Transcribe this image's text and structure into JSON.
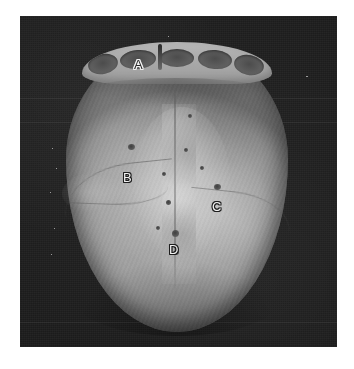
{
  "figure": {
    "kind": "anatomical-photograph",
    "plate": {
      "left": 20,
      "top": 16,
      "width": 317,
      "height": 331,
      "background_color": "#1c1c1c",
      "page_color": "#ffffff"
    },
    "specimen": {
      "bone_color": "#a8a8a8",
      "bone_highlight": "#c6c6c6",
      "bone_shadow": "#6f6f6f",
      "socket_color": "#4c4c4c",
      "foramen_color": "#3f3f3f"
    },
    "labels": [
      {
        "id": "a",
        "text": "A",
        "style": "dark-glyph-light-outline",
        "x": 138,
        "y": 65,
        "points_to": "frontal bone / supraorbital margin region at top of the cranium"
      },
      {
        "id": "b",
        "text": "B",
        "style": "light-glyph-dark-outline",
        "x": 127,
        "y": 178,
        "points_to": "left parietal bone with parietal foramen below the letter"
      },
      {
        "id": "c",
        "text": "C",
        "style": "light-glyph-dark-outline",
        "x": 216,
        "y": 207,
        "points_to": "right parietal bone with emissary foramen below the letter"
      },
      {
        "id": "d",
        "text": "D",
        "style": "light-glyph-dark-outline",
        "x": 173,
        "y": 250,
        "points_to": "sagittal suture / posterior midline"
      }
    ],
    "features": {
      "sagittal_suture": "faint vertical midline groove running front to back",
      "squamous_sutures": "curved lines on the left and right lateral surfaces",
      "orbital_notches": "five dark depressions along the anterior (top) rim",
      "foramina": "small dark pits clustered near the midline and beside labels B and C"
    }
  }
}
